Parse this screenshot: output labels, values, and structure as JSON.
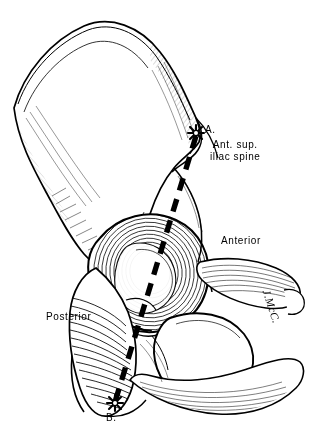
{
  "figure": {
    "background_color": "#ffffff",
    "ink_color": "#000000",
    "width": 318,
    "height": 435
  },
  "labels": {
    "point_a": "A.",
    "point_b": "B.",
    "asis_line1": "Ant. sup.",
    "asis_line2": "iliac spine",
    "anterior": "Anterior",
    "posterior": "Posterior"
  },
  "signature": {
    "text": "J.McC."
  },
  "markers": {
    "point_a_icon": "starburst-marker",
    "point_b_icon": "starburst-marker"
  },
  "axis": {
    "style": "dashed",
    "description": "thick dashed reference line from point A to point B through acetabulum"
  }
}
